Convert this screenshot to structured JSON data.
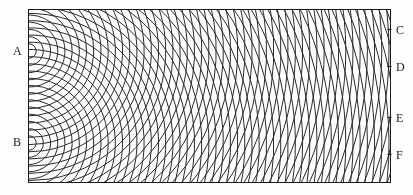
{
  "figure": {
    "background_color": "#fdfdfc",
    "ink_color": "#2a2a2a",
    "border_color": "#1a1a1a"
  },
  "labels": {
    "source_a": "A",
    "source_b": "B",
    "screen_c": "C",
    "screen_d": "D",
    "screen_e": "E",
    "screen_f": "F"
  },
  "chart_data": {
    "type": "scatter",
    "xlabel": "",
    "ylabel": "",
    "grid": false,
    "legend": "none",
    "xlim": [
      0,
      413
    ],
    "ylim": [
      0,
      195
    ],
    "frame": {
      "left": 28,
      "top": 9,
      "right": 391,
      "bottom": 183
    },
    "sources": [
      {
        "name": "A",
        "x": 29,
        "y": 51,
        "label_x": 13,
        "label_y": 45
      },
      {
        "name": "B",
        "x": 29,
        "y": 143,
        "label_x": 13,
        "label_y": 136
      }
    ],
    "screen_marks": [
      {
        "name": "C",
        "x": 391,
        "y": 29,
        "label_x": 396,
        "label_y": 24
      },
      {
        "name": "D",
        "x": 391,
        "y": 66,
        "label_x": 396,
        "label_y": 61
      },
      {
        "name": "E",
        "x": 391,
        "y": 117,
        "label_x": 396,
        "label_y": 112
      },
      {
        "name": "F",
        "x": 391,
        "y": 154,
        "label_x": 396,
        "label_y": 149
      }
    ],
    "wavelength_px": 7.2,
    "num_arcs_per_source": 62,
    "arc_line_width": 1.0,
    "source_separation_px": 92,
    "series": [
      {
        "name": "wavefronts from A",
        "kind": "concentric-arcs",
        "center": [
          29,
          51
        ],
        "spacing": 7.2,
        "count": 62
      },
      {
        "name": "wavefronts from B",
        "kind": "concentric-arcs",
        "center": [
          29,
          143
        ],
        "spacing": 7.2,
        "count": 62
      }
    ]
  }
}
